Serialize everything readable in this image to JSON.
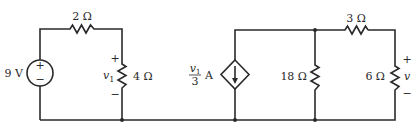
{
  "diagram": {
    "type": "circuit-schematic",
    "left_loop": {
      "voltage_source": {
        "label": "9 V",
        "plus": "+",
        "minus": "−"
      },
      "series_resistor": {
        "label": "2 Ω"
      },
      "load_resistor": {
        "label": "4 Ω",
        "voltage_label": "v",
        "voltage_subscript": "1",
        "plus": "+",
        "minus": "−"
      }
    },
    "right_network": {
      "dependent_current_source": {
        "numerator": "v",
        "numerator_subscript": "1",
        "denominator": "3",
        "unit": "A"
      },
      "shunt_resistor": {
        "label": "18 Ω"
      },
      "series_resistor": {
        "label": "3 Ω"
      },
      "output_resistor": {
        "label": "6 Ω",
        "voltage_label": "v",
        "plus": "+",
        "minus": "−"
      }
    }
  }
}
